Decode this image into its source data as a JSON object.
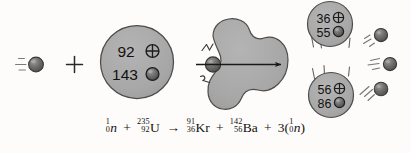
{
  "figure": {
    "background_color": "#fdfcfa",
    "ink_color": "#141210",
    "nucleus_fill": "#a9a9a9",
    "nucleus_stroke": "#4a4a4a",
    "neutron_fill": "#6d6d6d",
    "neutron_stroke": "#3a3a3a"
  },
  "reactants": {
    "incoming_neutron": {
      "label": "neutron",
      "motion_lines": 3
    },
    "plus_sign": "+",
    "uranium_nucleus": {
      "label": "uranium-235 nucleus",
      "protons": "92",
      "proton_symbol": "⊕",
      "neutrons": "143",
      "neutron_symbol": "●"
    }
  },
  "intermediate": {
    "label": "deformed compound nucleus splitting",
    "struck_neutron_label": "neutron at impact point",
    "impact_lines": 4,
    "arrow_label": "fission direction arrow"
  },
  "products": {
    "fragment_top": {
      "label": "krypton-91 fragment",
      "protons": "36",
      "proton_symbol": "⊕",
      "neutrons": "55",
      "neutron_symbol": "●",
      "recoil_lines": 3
    },
    "fragment_bottom": {
      "label": "barium-142 fragment",
      "protons": "56",
      "proton_symbol": "⊕",
      "neutrons": "86",
      "neutron_symbol": "●",
      "recoil_lines": 3
    },
    "emitted_neutrons": [
      {
        "label": "emitted neutron 1"
      },
      {
        "label": "emitted neutron 2"
      },
      {
        "label": "emitted neutron 3"
      }
    ]
  },
  "equation": {
    "full_text": "1/0 n + 235/92 U → 91/36 Kr + 142/56 Ba + 3(1/0 n)",
    "neutron_in": {
      "mass": "1",
      "atomic": "0",
      "symbol": "n"
    },
    "plus1": "+",
    "uranium": {
      "mass": "235",
      "atomic": "92",
      "symbol": "U"
    },
    "arrow": "→",
    "krypton": {
      "mass": "91",
      "atomic": "36",
      "symbol": "Kr"
    },
    "plus2": "+",
    "barium": {
      "mass": "142",
      "atomic": "56",
      "symbol": "Ba"
    },
    "plus3": "+",
    "multiplier": "3(",
    "neutron_out": {
      "mass": "1",
      "atomic": "0",
      "symbol": "n"
    },
    "close_paren": ")"
  }
}
